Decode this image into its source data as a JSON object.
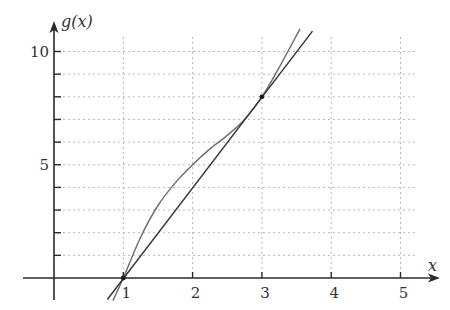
{
  "chart_data": {
    "type": "line",
    "title": "",
    "xlabel": "x",
    "ylabel": "g(x)",
    "xlim": [
      -0.45,
      5.55
    ],
    "ylim": [
      -1,
      11.5
    ],
    "grid": true,
    "x_ticks": [
      1,
      2,
      3,
      4,
      5
    ],
    "x_tick_labels": [
      "1",
      "2",
      "3",
      "4",
      "5"
    ],
    "y_ticks": [
      1,
      2,
      3,
      4,
      5,
      6,
      7,
      8,
      9,
      10
    ],
    "y_tick_labels": [
      "",
      "",
      "",
      "",
      "5",
      "",
      "",
      "",
      "",
      "10"
    ],
    "series": [
      {
        "name": "g(x) curve",
        "style": "curve",
        "color": "#707070",
        "x": [
          0.85,
          1.0,
          1.25,
          1.5,
          1.75,
          2.0,
          2.25,
          2.5,
          2.75,
          3.0,
          3.25,
          3.55
        ],
        "y": [
          -1.0,
          0.0,
          1.8,
          3.2,
          4.2,
          5.0,
          5.7,
          6.3,
          7.0,
          8.0,
          9.3,
          11.0
        ]
      },
      {
        "name": "secant line through (1,0) and (3,8)",
        "style": "line",
        "color": "#3a3a3a",
        "x": [
          0.77,
          3.73
        ],
        "y": [
          -0.95,
          10.9
        ]
      }
    ],
    "points": [
      {
        "x": 1,
        "y": 0,
        "label": ""
      },
      {
        "x": 3,
        "y": 8,
        "label": ""
      }
    ]
  }
}
